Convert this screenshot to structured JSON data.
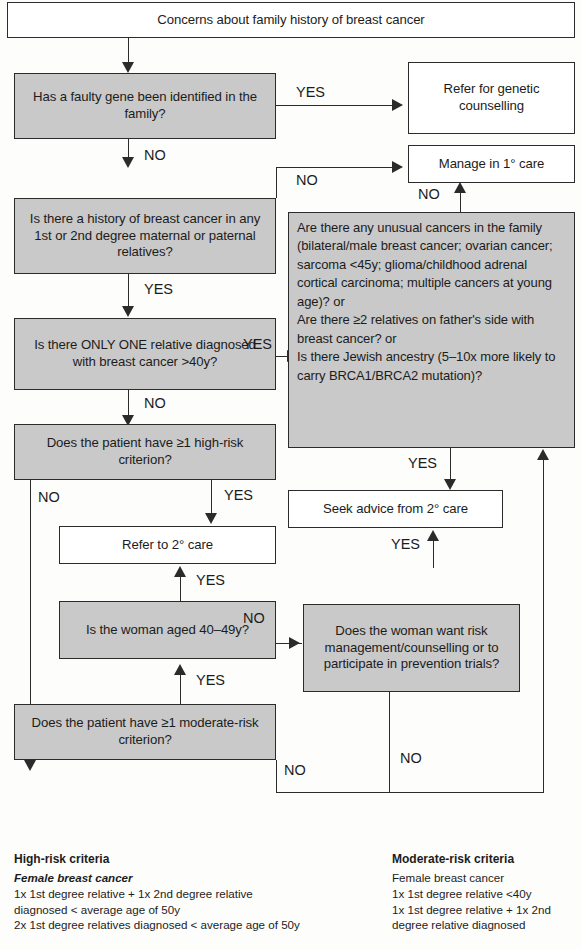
{
  "chart_title": "Concerns about family history of breast cancer — management flowchart",
  "nodes": {
    "start": "Concerns about family history of breast cancer",
    "faulty_gene": "Has a faulty gene been identified in the family?",
    "refer_genetic": "Refer for genetic counselling",
    "manage_primary": "Manage in 1° care",
    "history_breast": "Is there a history of breast cancer in any 1st or 2nd degree maternal or paternal relatives?",
    "only_one_relative": "Is there ONLY ONE relative diagnosed with breast cancer >40y?",
    "unusual_cancers": "Are there any unusual cancers in the family (bilateral/male breast cancer; ovarian cancer; sarcoma <45y; glioma/childhood adrenal cortical carcinoma; multiple cancers at young age)? or\nAre there ≥2 relatives on father's side with breast cancer? or\nIs there Jewish ancestry (5–10x more likely to carry BRCA1/BRCA2 mutation)?",
    "high_risk_q": "Does the patient have ≥1 high-risk criterion?",
    "refer_secondary": "Refer to 2° care",
    "seek_advice": "Seek advice from 2° care",
    "woman_aged": "Is the woman aged 40–49y?",
    "want_risk_mgmt": "Does the woman want risk management/counselling or to participate in prevention trials?",
    "moderate_risk_q": "Does the patient have ≥1 moderate-risk criterion?"
  },
  "edges": {
    "yes": "YES",
    "no": "NO",
    "gene_yes": "YES",
    "gene_no": "NO",
    "history_no": "NO",
    "history_yes": "YES",
    "onlyone_yes": "YES",
    "onlyone_no": "NO",
    "unusual_no": "NO",
    "unusual_yes": "YES",
    "highrisk_yes": "YES",
    "highrisk_no": "NO",
    "woman_yes_up": "YES",
    "woman_no": "NO",
    "moderate_yes": "YES",
    "moderate_no": "NO",
    "seek_yes": "YES",
    "want_no": "NO"
  },
  "legend_high": {
    "heading": "High-risk criteria",
    "subheading": "Female breast cancer",
    "lines": [
      "1x 1st degree relative + 1x 2nd degree relative",
      "diagnosed < average age of 50y",
      "2x 1st degree relatives diagnosed < average age of 50y"
    ]
  },
  "legend_moderate": {
    "heading": "Moderate-risk criteria",
    "subheading": "Female breast cancer",
    "lines": [
      "1x 1st degree relative <40y",
      "1x 1st degree relative + 1x 2nd",
      "degree relative diagnosed"
    ]
  },
  "colors": {
    "shaded_box": "#c9c9c9",
    "plain_box": "#ffffff",
    "stroke": "#2b2b2b",
    "page_bg": "#fdfdfc"
  }
}
